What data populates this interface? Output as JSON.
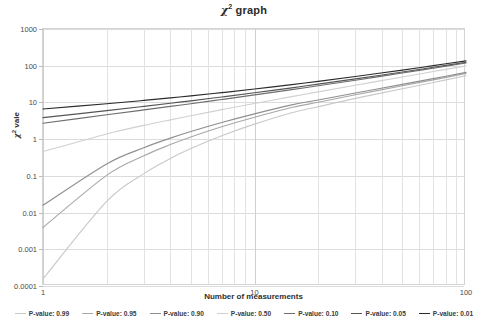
{
  "chart_data": {
    "type": "line",
    "title_parts": {
      "symbol": "χ",
      "sup": "2",
      "rest": " graph"
    },
    "xlabel": "Number of measurements",
    "ylabel": "χ² vale",
    "ylabel_parts": {
      "symbol": "χ",
      "sup": "2",
      "rest": " vale"
    },
    "xscale": "log",
    "yscale": "log",
    "xlim": [
      1,
      100
    ],
    "ylim": [
      0.0001,
      1000
    ],
    "grid": true,
    "legend_position": "bottom",
    "xticks": [
      "1",
      "10",
      "100"
    ],
    "xtick_values": [
      1,
      10,
      100
    ],
    "yticks": [
      "0.0001",
      "0.001",
      "0.01",
      "0.1",
      "1",
      "10",
      "100",
      "1000"
    ],
    "ytick_values": [
      0.0001,
      0.001,
      0.01,
      0.1,
      1,
      10,
      100,
      1000
    ],
    "x": [
      1,
      2,
      3,
      4,
      5,
      7,
      10,
      15,
      20,
      30,
      50,
      70,
      100
    ],
    "series": [
      {
        "name": "P-value: 0.99",
        "color": "#c9c9c9",
        "values": [
          0.000157,
          0.0201,
          0.115,
          0.297,
          0.554,
          1.24,
          2.56,
          5.23,
          7.63,
          12.9,
          23.6,
          34.8,
          53.5
        ]
      },
      {
        "name": "P-value: 0.95",
        "color": "#a8a8a8",
        "values": [
          0.00393,
          0.103,
          0.352,
          0.711,
          1.145,
          2.17,
          3.94,
          7.26,
          10.12,
          16.15,
          28.5,
          41.2,
          62.0
        ]
      },
      {
        "name": "P-value: 0.90",
        "color": "#8f8f8f",
        "values": [
          0.0158,
          0.211,
          0.584,
          1.064,
          1.61,
          2.83,
          4.87,
          8.55,
          11.65,
          18.1,
          31.1,
          44.4,
          65.9
        ]
      },
      {
        "name": "P-value: 0.50",
        "color": "#d0d0d0",
        "values": [
          0.455,
          1.386,
          2.366,
          3.357,
          4.351,
          6.346,
          9.342,
          14.34,
          19.34,
          29.34,
          49.33,
          69.33,
          99.33
        ]
      },
      {
        "name": "P-value: 0.10",
        "color": "#6e6e6e",
        "values": [
          2.706,
          4.605,
          6.251,
          7.779,
          9.236,
          12.02,
          15.99,
          22.31,
          28.41,
          40.26,
          63.17,
          85.53,
          118.5
        ]
      },
      {
        "name": "P-value: 0.05",
        "color": "#555555",
        "values": [
          3.841,
          5.991,
          7.815,
          9.488,
          11.07,
          14.07,
          18.31,
          25.0,
          31.41,
          43.77,
          67.5,
          90.53,
          124.3
        ]
      },
      {
        "name": "P-value: 0.01",
        "color": "#2b2b2b",
        "values": [
          6.635,
          9.21,
          11.34,
          13.28,
          15.09,
          18.48,
          23.21,
          30.58,
          37.57,
          50.89,
          76.15,
          100.4,
          135.8
        ]
      }
    ]
  }
}
